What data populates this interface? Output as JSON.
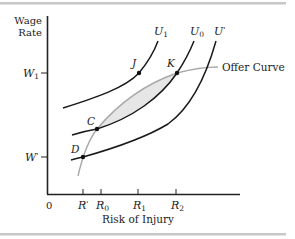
{
  "figure": {
    "y_axis_label_line1": "Wage",
    "y_axis_label_line2": "Rate",
    "x_axis_label": "Risk of Injury",
    "origin_label": "0",
    "y_ticks": [
      {
        "label_main": "W",
        "label_sub": "1",
        "label_sup": ""
      },
      {
        "label_main": "W",
        "label_sub": "",
        "label_sup": "'"
      }
    ],
    "x_ticks": [
      {
        "label_main": "R",
        "label_sub": "",
        "label_sup": "'"
      },
      {
        "label_main": "R",
        "label_sub": "0",
        "label_sup": ""
      },
      {
        "label_main": "R",
        "label_sub": "1",
        "label_sup": ""
      },
      {
        "label_main": "R",
        "label_sub": "2",
        "label_sup": ""
      }
    ],
    "curves": [
      {
        "label_main": "U",
        "label_sub": "1",
        "label_sup": ""
      },
      {
        "label_main": "U",
        "label_sub": "0",
        "label_sup": ""
      },
      {
        "label_main": "U",
        "label_sub": "",
        "label_sup": "'"
      }
    ],
    "offer_curve_label": "Offer Curve",
    "points": [
      {
        "label": "J"
      },
      {
        "label": "K"
      },
      {
        "label": "C"
      },
      {
        "label": "D"
      }
    ],
    "colors": {
      "axis": "#222222",
      "indifference_curve": "#1a1a1a",
      "offer_curve": "#a8a8a8",
      "shaded_region": "#e6e6e6",
      "rule": "#c8c8c8"
    }
  }
}
